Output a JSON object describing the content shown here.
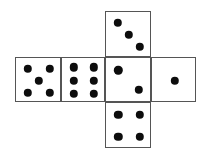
{
  "figure": {
    "name": "cube-net-dice",
    "canvas": {
      "width": 207,
      "height": 158
    },
    "colors": {
      "background": "#ffffff",
      "face_fill": "#ffffff",
      "face_stroke": "#555555",
      "pip_fill": "#0d0d0d"
    },
    "pip_radius": 4.2,
    "stroke_width": 1.5
  },
  "faces": [
    {
      "id": "face-left-outer",
      "position_label": "left-outer",
      "value": 5,
      "box": {
        "x": 15,
        "y": 57,
        "w": 46,
        "h": 45
      },
      "pips": [
        {
          "cx": 0.26,
          "cy": 0.24
        },
        {
          "cx": 0.74,
          "cy": 0.24
        },
        {
          "cx": 0.5,
          "cy": 0.5
        },
        {
          "cx": 0.26,
          "cy": 0.77
        },
        {
          "cx": 0.74,
          "cy": 0.77
        }
      ]
    },
    {
      "id": "face-left-inner",
      "position_label": "left-inner",
      "value": 6,
      "box": {
        "x": 61,
        "y": 57,
        "w": 44,
        "h": 45
      },
      "pips": [
        {
          "cx": 0.27,
          "cy": 0.21
        },
        {
          "cx": 0.72,
          "cy": 0.21
        },
        {
          "cx": 0.27,
          "cy": 0.5
        },
        {
          "cx": 0.72,
          "cy": 0.5
        },
        {
          "cx": 0.27,
          "cy": 0.79
        },
        {
          "cx": 0.72,
          "cy": 0.79
        }
      ]
    },
    {
      "id": "face-center",
      "position_label": "center",
      "value": 2,
      "box": {
        "x": 105,
        "y": 57,
        "w": 46,
        "h": 45
      },
      "pips": [
        {
          "cx": 0.27,
          "cy": 0.27
        },
        {
          "cx": 0.71,
          "cy": 0.71
        }
      ]
    },
    {
      "id": "face-right-outer",
      "position_label": "right-outer",
      "value": 1,
      "box": {
        "x": 151,
        "y": 57,
        "w": 45,
        "h": 45
      },
      "pips": [
        {
          "cx": 0.5,
          "cy": 0.5
        }
      ]
    },
    {
      "id": "face-top",
      "position_label": "top",
      "value": 3,
      "box": {
        "x": 105,
        "y": 11,
        "w": 46,
        "h": 46
      },
      "pips": [
        {
          "cx": 0.25,
          "cy": 0.23
        },
        {
          "cx": 0.5,
          "cy": 0.5
        },
        {
          "cx": 0.74,
          "cy": 0.76
        }
      ]
    },
    {
      "id": "face-bottom",
      "position_label": "bottom",
      "value": 4,
      "box": {
        "x": 105,
        "y": 102,
        "w": 46,
        "h": 46
      },
      "pips": [
        {
          "cx": 0.27,
          "cy": 0.26
        },
        {
          "cx": 0.73,
          "cy": 0.26
        },
        {
          "cx": 0.27,
          "cy": 0.74
        },
        {
          "cx": 0.73,
          "cy": 0.74
        }
      ]
    }
  ]
}
